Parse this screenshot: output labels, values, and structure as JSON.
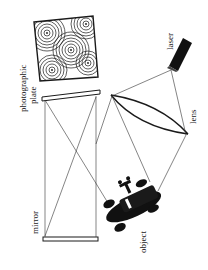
{
  "diagram": {
    "colors": {
      "ink": "#1a1a1a",
      "background": "#ffffff"
    },
    "labels": {
      "photographic_plate_line1": "photographic",
      "photographic_plate_line2": "plate",
      "laser": "laser",
      "lens": "lens",
      "mirror": "mirror",
      "object": "object"
    },
    "components": [
      {
        "name": "interference-pattern-inset",
        "kind": "square with concentric ring patterns"
      },
      {
        "name": "laser",
        "kind": "black cylinder"
      },
      {
        "name": "lens",
        "kind": "biconvex beam splitter lens"
      },
      {
        "name": "photographic-plate",
        "kind": "plate"
      },
      {
        "name": "mirror",
        "kind": "flat mirror"
      },
      {
        "name": "object",
        "kind": "toy car"
      }
    ]
  }
}
